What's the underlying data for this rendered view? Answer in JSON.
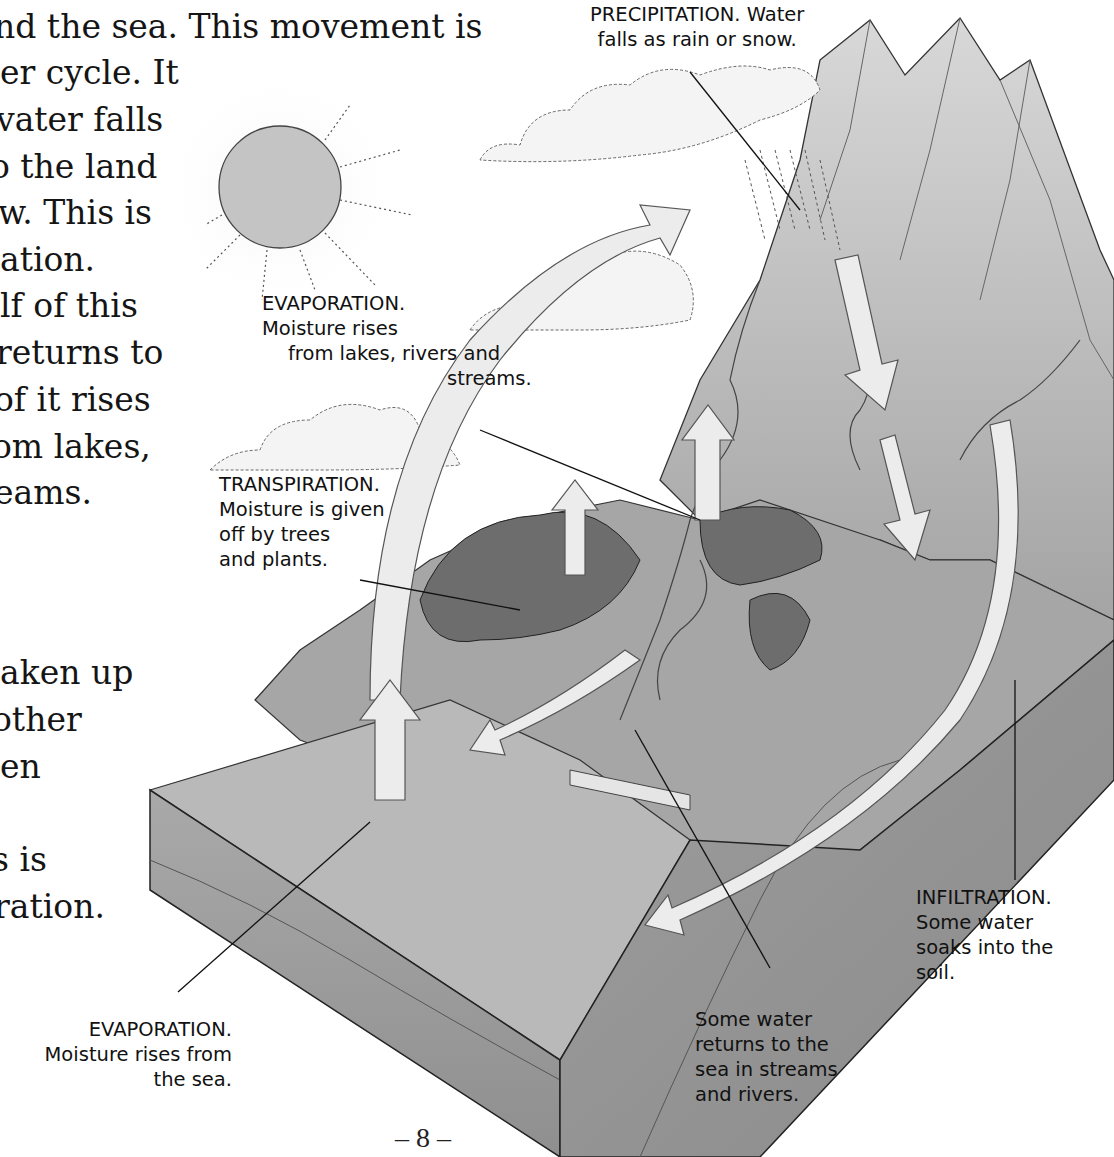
{
  "body_text": {
    "lines": [
      "nd the sea. This movement is",
      "er cycle. It",
      "vater falls",
      "o the land",
      "w. This is",
      "ation.",
      "lf of this",
      " returns to",
      "of it rises",
      "om lakes,",
      "eams.",
      "aken up",
      "other",
      "en",
      "s is",
      "ration."
    ]
  },
  "diagram": {
    "title_hidden": "Water cycle illustration",
    "labels": {
      "precipitation": [
        "PRECIPITATION. Water",
        "falls as rain or snow."
      ],
      "evaporation_lakes": [
        "EVAPORATION.",
        "Moisture rises",
        "from lakes, rivers and",
        "streams."
      ],
      "transpiration": [
        "TRANSPIRATION.",
        "Moisture is given",
        "off by trees",
        "and plants."
      ],
      "evaporation_sea": [
        "EVAPORATION.",
        "Moisture rises from",
        "the sea."
      ],
      "runoff": [
        "Some water",
        "returns to the",
        "sea in streams",
        "and rivers."
      ],
      "infiltration": [
        "INFILTRATION.",
        "Some water",
        "soaks into the",
        "soil."
      ]
    },
    "icons": {
      "sun": "sun-icon",
      "clouds": "cloud-icon",
      "rain": "rain-icon",
      "arrows": "arrow-icon"
    },
    "colors": {
      "land": "#a8a8a8",
      "side_face": "#9a9a9a",
      "sea_top": "#b6b6b6",
      "arrow_fill": "#ececec",
      "sun": "#c4c4c4",
      "trees": "#6e6e6e",
      "mountain": "#bdbdbd"
    }
  },
  "footer": {
    "page_number": "– 8 –"
  }
}
